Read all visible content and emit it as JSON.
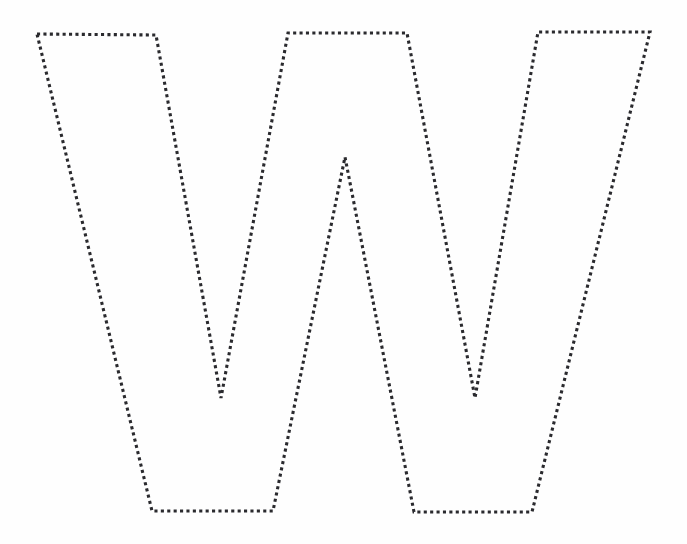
{
  "page": {
    "kind": "tracing-worksheet",
    "background_color": "#fefefe",
    "canvas_width": 687,
    "canvas_height": 544
  },
  "shape": {
    "name": "letter-w-outline",
    "letter": "W",
    "style": "dotted",
    "stroke_color": "#2a2a2e",
    "fill_color": "none",
    "stroke_width": 3.1,
    "dash_length": 3.1,
    "gap_length": 3.3,
    "closed": true,
    "vertices": [
      [
        37,
        34
      ],
      [
        156,
        35
      ],
      [
        221,
        398
      ],
      [
        288,
        33
      ],
      [
        407,
        33
      ],
      [
        475,
        398
      ],
      [
        538,
        32
      ],
      [
        650,
        32
      ],
      [
        532,
        512
      ],
      [
        414,
        512
      ],
      [
        345,
        157
      ],
      [
        273,
        511
      ],
      [
        152,
        511
      ]
    ],
    "vertex_labels": [
      "top-left-outer",
      "top-left-inner",
      "valley-left-bottom",
      "top-mid-left",
      "top-mid-right",
      "valley-right-bottom",
      "top-right-inner",
      "top-right-outer",
      "bottom-right-outer",
      "bottom-right-inner",
      "middle-peak-apex",
      "bottom-left-inner",
      "bottom-left-outer"
    ]
  }
}
